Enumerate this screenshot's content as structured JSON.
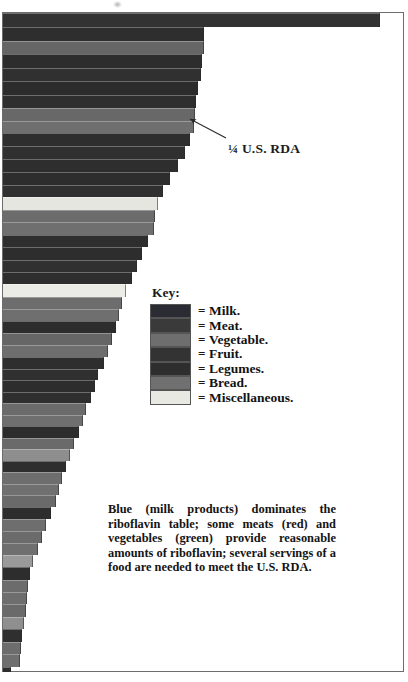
{
  "figure": {
    "annotation_label": "¼ U.S. RDA",
    "caption": "Blue (milk products) dominates the riboflavin table; some meats (red) and vegetables (green) provide reasonable amounts of riboflavin; several servings of a food are needed to meet the U.S. RDA."
  },
  "legend": {
    "title": "Key:",
    "equals": "=",
    "items": [
      {
        "label": "Milk.",
        "color": "#2b2b33"
      },
      {
        "label": "Meat.",
        "color": "#3a3a3a"
      },
      {
        "label": "Vegetable.",
        "color": "#6e6e6e"
      },
      {
        "label": "Fruit.",
        "color": "#333333"
      },
      {
        "label": "Legumes.",
        "color": "#2e2e2e"
      },
      {
        "label": "Bread.",
        "color": "#707070"
      },
      {
        "label": "Miscellaneous.",
        "color": "#e9e9e4"
      }
    ]
  },
  "chart_data": {
    "type": "bar",
    "orientation": "horizontal",
    "title": "",
    "subtitle": "",
    "xlabel": "",
    "ylabel": "",
    "grid": false,
    "legend_position": "center-right",
    "axis_note": "Bar length encodes riboflavin content per serving; the ¼ U.S. RDA marker falls at the annotated bar edge.",
    "xlim": [
      0,
      100
    ],
    "reference_marker": {
      "label": "¼ U.S. RDA",
      "value": 49
    },
    "categories": [
      "Milk 1",
      "Milk 2",
      "Vegetable 1",
      "Milk 3",
      "Milk 4",
      "Milk 5",
      "Milk 6",
      "Vegetable 2",
      "Bread 1",
      "Milk 7",
      "Milk 8",
      "Milk 9",
      "Milk 10",
      "Milk 11",
      "Misc 1",
      "Vegetable 3",
      "Bread 2",
      "Milk 12",
      "Milk 13",
      "Milk 14",
      "Milk 15",
      "Misc 2",
      "Vegetable 4",
      "Bread 3",
      "Milk 16",
      "Vegetable 5",
      "Bread 4",
      "Milk 17",
      "Milk 18",
      "Milk 19",
      "Milk 20",
      "Vegetable 6",
      "Bread 5",
      "Milk 21",
      "Vegetable 7",
      "Misc 3",
      "Milk 22",
      "Vegetable 8",
      "Bread 6",
      "Vegetable 9",
      "Milk 23",
      "Vegetable 10",
      "Vegetable 11",
      "Bread 7",
      "Milk 24"
    ],
    "values": [
      99.0,
      51.5,
      51.5,
      50.5,
      50.3,
      49.5,
      48.8,
      48.5,
      48.3,
      47.0,
      45.5,
      43.8,
      41.5,
      39.8,
      38.5,
      37.8,
      37.5,
      36.0,
      34.5,
      33.0,
      31.8,
      30.0,
      29.0,
      28.3,
      27.5,
      26.3,
      25.3,
      24.0,
      22.5,
      21.8,
      20.8,
      19.5,
      18.8,
      17.5,
      16.3,
      15.3,
      14.0,
      13.0,
      12.3,
      11.5,
      10.0,
      8.3,
      7.0,
      5.5,
      2.8
    ],
    "series": [
      {
        "name": "Riboflavin per serving",
        "values": [
          99.0,
          51.5,
          51.5,
          50.5,
          50.3,
          49.5,
          48.8,
          48.5,
          48.3,
          47.0,
          45.5,
          43.8,
          41.5,
          39.8,
          38.5,
          37.8,
          37.5,
          36.0,
          34.5,
          33.0,
          31.8,
          30.0,
          29.0,
          28.3,
          27.5,
          26.3,
          25.3,
          24.0,
          22.5,
          21.8,
          20.8,
          19.5,
          18.8,
          17.5,
          16.3,
          15.3,
          14.0,
          13.0,
          12.3,
          11.5,
          10.0,
          8.3,
          7.0,
          5.5,
          2.8
        ]
      }
    ],
    "group_of_each_bar": [
      "Milk",
      "Milk",
      "Vegetable",
      "Milk",
      "Milk",
      "Milk",
      "Milk",
      "Vegetable",
      "Bread",
      "Milk",
      "Milk",
      "Milk",
      "Milk",
      "Milk",
      "Miscellaneous",
      "Vegetable",
      "Bread",
      "Milk",
      "Milk",
      "Milk",
      "Milk",
      "Miscellaneous",
      "Vegetable",
      "Bread",
      "Milk",
      "Vegetable",
      "Bread",
      "Milk",
      "Milk",
      "Milk",
      "Milk",
      "Vegetable",
      "Bread",
      "Milk",
      "Vegetable",
      "Miscellaneous",
      "Milk",
      "Vegetable",
      "Bread",
      "Vegetable",
      "Milk",
      "Vegetable",
      "Vegetable",
      "Bread",
      "Milk"
    ],
    "bar_geometry": [
      {
        "top": 13,
        "height": 14,
        "right": 380,
        "color": "#323232"
      },
      {
        "top": 27,
        "height": 14,
        "right": 204,
        "color": "#2e2e2e"
      },
      {
        "top": 41,
        "height": 13,
        "right": 204,
        "color": "#666666"
      },
      {
        "top": 54,
        "height": 14,
        "right": 202,
        "color": "#2d2d2d"
      },
      {
        "top": 68,
        "height": 13,
        "right": 201,
        "color": "#303030"
      },
      {
        "top": 81,
        "height": 14,
        "right": 198,
        "color": "#2c2c2c"
      },
      {
        "top": 95,
        "height": 13,
        "right": 196,
        "color": "#2e2e2e"
      },
      {
        "top": 108,
        "height": 13,
        "right": 195,
        "color": "#686868"
      },
      {
        "top": 121,
        "height": 12,
        "right": 194,
        "color": "#6f6f6f"
      },
      {
        "top": 133,
        "height": 13,
        "right": 190,
        "color": "#2e2e2e"
      },
      {
        "top": 146,
        "height": 13,
        "right": 185,
        "color": "#303030"
      },
      {
        "top": 159,
        "height": 13,
        "right": 178,
        "color": "#2e2e2e"
      },
      {
        "top": 172,
        "height": 13,
        "right": 170,
        "color": "#2d2d2d"
      },
      {
        "top": 185,
        "height": 12,
        "right": 163,
        "color": "#303030"
      },
      {
        "top": 197,
        "height": 13,
        "right": 158,
        "color": "#e6e6e0"
      },
      {
        "top": 210,
        "height": 12,
        "right": 155,
        "color": "#6c6c6c"
      },
      {
        "top": 222,
        "height": 13,
        "right": 154,
        "color": "#6f6f6f"
      },
      {
        "top": 235,
        "height": 12,
        "right": 148,
        "color": "#2e2e2e"
      },
      {
        "top": 247,
        "height": 13,
        "right": 142,
        "color": "#2d2d2d"
      },
      {
        "top": 260,
        "height": 12,
        "right": 137,
        "color": "#303030"
      },
      {
        "top": 272,
        "height": 12,
        "right": 132,
        "color": "#2e2e2e"
      },
      {
        "top": 284,
        "height": 13,
        "right": 126,
        "color": "#ecece6"
      },
      {
        "top": 297,
        "height": 12,
        "right": 122,
        "color": "#6d6d6d"
      },
      {
        "top": 309,
        "height": 12,
        "right": 119,
        "color": "#6f6f6f"
      },
      {
        "top": 321,
        "height": 12,
        "right": 116,
        "color": "#2d2d2d"
      },
      {
        "top": 333,
        "height": 12,
        "right": 112,
        "color": "#666666"
      },
      {
        "top": 345,
        "height": 12,
        "right": 108,
        "color": "#6e6e6e"
      },
      {
        "top": 357,
        "height": 12,
        "right": 104,
        "color": "#2e2e2e"
      },
      {
        "top": 369,
        "height": 11,
        "right": 98,
        "color": "#303030"
      },
      {
        "top": 380,
        "height": 12,
        "right": 95,
        "color": "#2d2d2d"
      },
      {
        "top": 392,
        "height": 11,
        "right": 91,
        "color": "#2f2f2f"
      },
      {
        "top": 403,
        "height": 12,
        "right": 86,
        "color": "#6b6b6b"
      },
      {
        "top": 415,
        "height": 11,
        "right": 83,
        "color": "#6f6f6f"
      },
      {
        "top": 426,
        "height": 12,
        "right": 79,
        "color": "#2d2d2d"
      },
      {
        "top": 438,
        "height": 11,
        "right": 74,
        "color": "#6a6a6a"
      },
      {
        "top": 449,
        "height": 12,
        "right": 70,
        "color": "#8e8e8e"
      },
      {
        "top": 461,
        "height": 11,
        "right": 66,
        "color": "#2e2e2e"
      },
      {
        "top": 472,
        "height": 12,
        "right": 62,
        "color": "#6e6e6e"
      },
      {
        "top": 484,
        "height": 11,
        "right": 59,
        "color": "#707070"
      },
      {
        "top": 495,
        "height": 12,
        "right": 56,
        "color": "#6a6a6a"
      },
      {
        "top": 507,
        "height": 12,
        "right": 51,
        "color": "#2d2d2d"
      },
      {
        "top": 519,
        "height": 12,
        "right": 46,
        "color": "#6e6e6e"
      },
      {
        "top": 531,
        "height": 12,
        "right": 42,
        "color": "#6b6b6b"
      },
      {
        "top": 543,
        "height": 12,
        "right": 38,
        "color": "#6f6f6f"
      },
      {
        "top": 555,
        "height": 12,
        "right": 33,
        "color": "#9a9a9a"
      },
      {
        "top": 567,
        "height": 13,
        "right": 30,
        "color": "#2d2d2d"
      },
      {
        "top": 580,
        "height": 12,
        "right": 28,
        "color": "#6c6c6c"
      },
      {
        "top": 592,
        "height": 12,
        "right": 27,
        "color": "#6e6e6e"
      },
      {
        "top": 604,
        "height": 13,
        "right": 26,
        "color": "#6a6a6a"
      },
      {
        "top": 617,
        "height": 12,
        "right": 24,
        "color": "#8f8f8f"
      },
      {
        "top": 629,
        "height": 13,
        "right": 22,
        "color": "#2f2f2f"
      },
      {
        "top": 642,
        "height": 12,
        "right": 21,
        "color": "#6d6d6d"
      },
      {
        "top": 654,
        "height": 13,
        "right": 20,
        "color": "#6f6f6f"
      },
      {
        "top": 667,
        "height": 5,
        "right": 11,
        "color": "#2e2e2e"
      }
    ]
  }
}
